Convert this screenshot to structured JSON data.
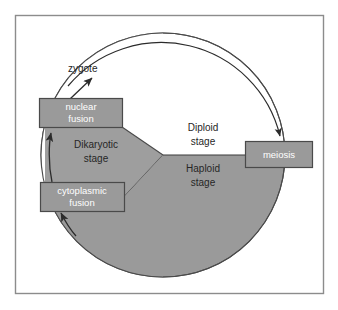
{
  "diagram": {
    "frame": {
      "border_color": "#8c8c8c",
      "background_color": "#ffffff"
    },
    "colors": {
      "gray_fill": "#9a9a9a",
      "gray_fill_alt": "#9e9e9e",
      "outline": "#4a4a4a",
      "box_border": "#4a4a4a",
      "white_text": "#ffffff",
      "dark_text": "#262626",
      "line": "#3a3a3a"
    },
    "boxes": [
      {
        "id": "nuclear-fusion",
        "line1": "nuclear",
        "line2": "fusion",
        "text_color": "#ffffff"
      },
      {
        "id": "cytoplasmic-fusion",
        "line1": "cytoplasmic",
        "line2": "fusion",
        "text_color": "#ffffff"
      },
      {
        "id": "meiosis",
        "line1": "meiosis",
        "line2": "",
        "text_color": "#ffffff"
      }
    ],
    "labels": [
      {
        "id": "zygote",
        "text": "zygote",
        "color": "#262626"
      },
      {
        "id": "diploid-stage-line1",
        "text": "Diploid",
        "color": "#262626"
      },
      {
        "id": "diploid-stage-line2",
        "text": "stage",
        "color": "#262626"
      },
      {
        "id": "haploid-stage-line1",
        "text": "Haploid",
        "color": "#262626"
      },
      {
        "id": "haploid-stage-line2",
        "text": "stage",
        "color": "#262626"
      },
      {
        "id": "dikaryotic-stage-line1",
        "text": "Dikaryotic",
        "color": "#262626"
      },
      {
        "id": "dikaryotic-stage-line2",
        "text": "stage",
        "color": "#262626"
      }
    ]
  }
}
